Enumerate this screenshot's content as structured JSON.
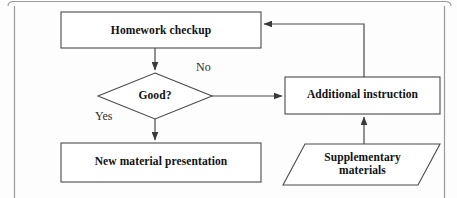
{
  "diagram": {
    "type": "flowchart",
    "nodes": [
      {
        "id": "homework",
        "shape": "process",
        "label": "Homework checkup"
      },
      {
        "id": "good",
        "shape": "decision",
        "label": "Good?"
      },
      {
        "id": "newmat",
        "shape": "process",
        "label": "New material presentation"
      },
      {
        "id": "additional",
        "shape": "process",
        "label": "Additional instruction"
      },
      {
        "id": "supp",
        "shape": "parallelogram",
        "label": "Supplementary\nmaterials"
      }
    ],
    "edges": [
      {
        "from": "homework",
        "to": "good",
        "label": ""
      },
      {
        "from": "good",
        "to": "additional",
        "label": "No"
      },
      {
        "from": "good",
        "to": "newmat",
        "label": "Yes"
      },
      {
        "from": "supp",
        "to": "additional",
        "label": ""
      },
      {
        "from": "additional",
        "to": "homework",
        "label": ""
      }
    ],
    "edge_labels": {
      "no": "No",
      "yes": "Yes"
    },
    "colors": {
      "shape_stroke": "#4a4a4a",
      "shape_fill": "#ffffff",
      "connector": "#4a4a4a",
      "frame": "#9a9a9a",
      "text": "#111111",
      "background": "#fdfdfd"
    }
  }
}
